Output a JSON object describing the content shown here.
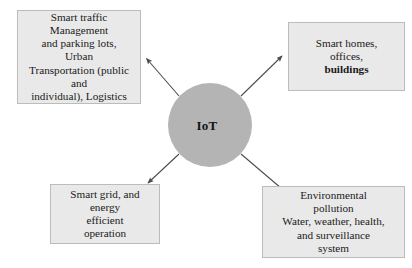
{
  "diagram": {
    "background_color": "#ffffff",
    "hub": {
      "label": "IoT",
      "fill_color": "#b4b4b4",
      "text_color": "#141414",
      "shape": "circle"
    },
    "box_style": {
      "fill_color": "#e9e9e9",
      "border_color": "#bcbcbc",
      "text_color": "#1a1a1a"
    },
    "arrow_color": "#4a4a4a",
    "nodes": [
      {
        "id": "traffic",
        "position": "top-left",
        "text": "Smart traffic\nManagement\nand parking lots,\nUrban\nTransportation (public\nand\nindividual), Logistics"
      },
      {
        "id": "homes",
        "position": "top-right",
        "text_line_1": "Smart homes,",
        "text_line_2": "offices,",
        "text_line_3_bold": "buildings"
      },
      {
        "id": "grid",
        "position": "bottom-left",
        "text": "Smart grid, and\nenergy\nefficient\noperation"
      },
      {
        "id": "environment",
        "position": "bottom-right",
        "text": "Environmental\npollution\nWater, weather, health,\nand surveillance\nsystem"
      }
    ],
    "arrows": [
      {
        "id": "hub-to-traffic",
        "from": "hub",
        "to": "traffic",
        "direction": "up-left"
      },
      {
        "id": "hub-to-homes",
        "from": "hub",
        "to": "homes",
        "direction": "up-right"
      },
      {
        "id": "hub-to-grid",
        "from": "hub",
        "to": "grid",
        "direction": "down-left"
      },
      {
        "id": "hub-to-environment",
        "from": "hub",
        "to": "environment",
        "direction": "down-right"
      }
    ]
  }
}
